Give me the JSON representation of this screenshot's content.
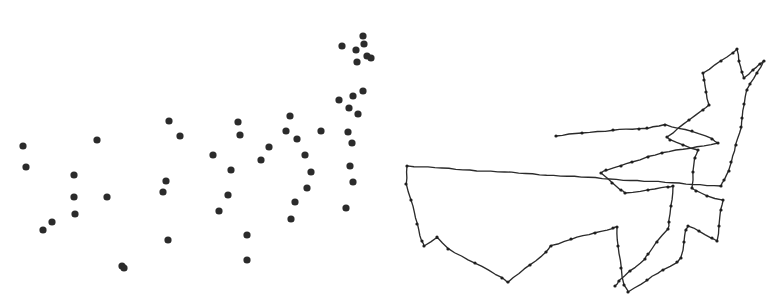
{
  "figure": {
    "width": 777,
    "height": 305,
    "background_color": "#ffffff",
    "ink_color": "#2b2b2b"
  },
  "chart_data": {
    "type": "scatter",
    "title": "",
    "subtitle": "",
    "xlabel": "",
    "ylabel": "",
    "grid": false,
    "legend": null,
    "axes_visible": false,
    "tick_labels": [],
    "annotations": [],
    "panels": [
      {
        "name": "point-pattern",
        "type": "scatter",
        "description": "Dot point pattern, denser toward upper right",
        "marker": "filled-circle",
        "marker_color": "#2b2b2b",
        "marker_radius": 3.6,
        "xlim": [
          0,
          389
        ],
        "ylim": [
          305,
          0
        ],
        "n_points": 52,
        "points": [
          [
            23,
            146
          ],
          [
            26,
            167
          ],
          [
            97,
            140
          ],
          [
            74,
            175
          ],
          [
            75,
            214
          ],
          [
            43,
            230
          ],
          [
            52,
            222
          ],
          [
            122,
            266
          ],
          [
            74,
            197
          ],
          [
            107,
            197
          ],
          [
            169,
            121
          ],
          [
            180,
            136
          ],
          [
            166,
            181
          ],
          [
            163,
            192
          ],
          [
            124,
            268
          ],
          [
            168,
            240
          ],
          [
            213,
            155
          ],
          [
            238,
            122
          ],
          [
            231,
            170
          ],
          [
            240,
            135
          ],
          [
            261,
            160
          ],
          [
            247,
            260
          ],
          [
            228,
            195
          ],
          [
            219,
            211
          ],
          [
            247,
            235
          ],
          [
            290,
            116
          ],
          [
            286,
            131
          ],
          [
            269,
            147
          ],
          [
            297,
            139
          ],
          [
            305,
            155
          ],
          [
            321,
            131
          ],
          [
            311,
            172
          ],
          [
            295,
            202
          ],
          [
            291,
            219
          ],
          [
            307,
            188
          ],
          [
            349,
            108
          ],
          [
            353,
            96
          ],
          [
            339,
            100
          ],
          [
            358,
            114
          ],
          [
            363,
            91
          ],
          [
            348,
            132
          ],
          [
            352,
            143
          ],
          [
            356,
            50
          ],
          [
            364,
            44
          ],
          [
            342,
            46
          ],
          [
            357,
            62
          ],
          [
            367,
            56
          ],
          [
            371,
            58
          ],
          [
            350,
            166
          ],
          [
            353,
            182
          ],
          [
            346,
            208
          ],
          [
            363,
            36
          ]
        ]
      },
      {
        "name": "boundary-outline",
        "type": "line",
        "description": "Closed hand-drawn polygonal boundary with marked vertices",
        "stroke_color": "#2b2b2b",
        "stroke_width": 1.35,
        "closed": true,
        "vertex_marker": "small-dot",
        "xlim": [
          389,
          777
        ],
        "ylim": [
          305,
          0
        ],
        "n_vertices": 57,
        "vertices": [
          [
            407,
            166
          ],
          [
            406,
            184
          ],
          [
            411,
            200
          ],
          [
            417,
            224
          ],
          [
            422,
            241
          ],
          [
            424,
            246
          ],
          [
            437,
            237
          ],
          [
            448,
            249
          ],
          [
            475,
            263
          ],
          [
            502,
            278
          ],
          [
            508,
            282
          ],
          [
            530,
            265
          ],
          [
            546,
            252
          ],
          [
            551,
            246
          ],
          [
            571,
            239
          ],
          [
            595,
            233
          ],
          [
            613,
            228
          ],
          [
            617,
            227
          ],
          [
            618,
            246
          ],
          [
            621,
            268
          ],
          [
            624,
            285
          ],
          [
            628,
            292
          ],
          [
            647,
            280
          ],
          [
            663,
            270
          ],
          [
            677,
            262
          ],
          [
            681,
            258
          ],
          [
            684,
            242
          ],
          [
            686,
            230
          ],
          [
            688,
            226
          ],
          [
            699,
            231
          ],
          [
            712,
            238
          ],
          [
            717,
            241
          ],
          [
            719,
            226
          ],
          [
            721,
            210
          ],
          [
            723,
            200
          ],
          [
            707,
            196
          ],
          [
            696,
            191
          ],
          [
            692,
            188
          ],
          [
            693,
            172
          ],
          [
            695,
            158
          ],
          [
            698,
            150
          ],
          [
            683,
            145
          ],
          [
            670,
            140
          ],
          [
            667,
            137
          ],
          [
            689,
            120
          ],
          [
            703,
            110
          ],
          [
            709,
            105
          ],
          [
            706,
            92
          ],
          [
            704,
            80
          ],
          [
            703,
            73
          ],
          [
            721,
            61
          ],
          [
            733,
            53
          ],
          [
            737,
            49
          ],
          [
            739,
            61
          ],
          [
            742,
            72
          ],
          [
            744,
            78
          ],
          [
            753,
            70
          ],
          [
            760,
            64
          ],
          [
            764,
            61
          ],
          [
            757,
            73
          ],
          [
            750,
            84
          ],
          [
            747,
            90
          ],
          [
            744,
            104
          ],
          [
            742,
            118
          ],
          [
            741,
            127
          ],
          [
            736,
            145
          ],
          [
            731,
            162
          ],
          [
            729,
            171
          ],
          [
            724,
            180
          ],
          [
            721,
            186
          ]
        ],
        "inner_detail_vertices": [
          [
            556,
            136
          ],
          [
            582,
            133
          ],
          [
            613,
            130
          ],
          [
            639,
            129
          ],
          [
            647,
            128
          ],
          [
            665,
            125
          ],
          [
            692,
            131
          ],
          [
            712,
            139
          ],
          [
            718,
            143
          ],
          [
            662,
            153
          ],
          [
            648,
            157
          ],
          [
            632,
            162
          ],
          [
            621,
            166
          ],
          [
            606,
            170
          ],
          [
            601,
            173
          ],
          [
            612,
            183
          ],
          [
            621,
            190
          ],
          [
            625,
            193
          ],
          [
            648,
            190
          ],
          [
            668,
            187
          ],
          [
            673,
            186
          ],
          [
            671,
            206
          ],
          [
            669,
            222
          ],
          [
            668,
            229
          ],
          [
            657,
            242
          ],
          [
            648,
            254
          ],
          [
            645,
            259
          ],
          [
            630,
            271
          ],
          [
            619,
            281
          ],
          [
            615,
            286
          ]
        ]
      }
    ]
  }
}
